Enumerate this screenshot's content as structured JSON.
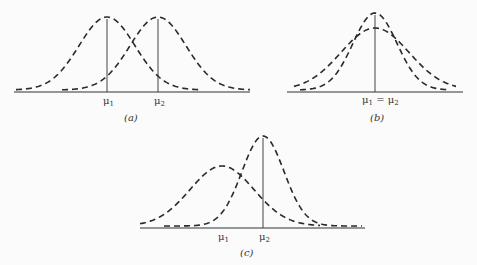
{
  "panels": [
    {
      "id": "a",
      "caption": "(a)",
      "description": "Two normal curves with equal spread and different means",
      "mean_labels": [
        "μ1",
        "μ2"
      ],
      "means_px": [
        107,
        158
      ],
      "sigma_px": 28,
      "peak_heights_px": [
        73,
        73
      ]
    },
    {
      "id": "b",
      "caption": "(b)",
      "description": "Two normal curves with equal means and different spreads",
      "mean_labels": [
        "μ1 = μ2"
      ],
      "means_px": [
        375,
        375
      ],
      "sigma_px": [
        22,
        34
      ],
      "peak_heights_px": [
        77,
        62
      ]
    },
    {
      "id": "c",
      "caption": "(c)",
      "description": "Two normal curves with different means and different spreads",
      "mean_labels": [
        "μ1",
        "μ2"
      ],
      "means_px": [
        222,
        263
      ],
      "sigma_px": [
        32,
        21
      ],
      "peak_heights_px": [
        60,
        90
      ]
    }
  ],
  "labels": {
    "a_mu1": "μ",
    "a_mu2": "μ",
    "b_mu": "μ",
    "b_eq": " = μ",
    "c_mu1": "μ",
    "c_mu2": "μ",
    "sub1": "1",
    "sub2": "2",
    "cap_a": "(a)",
    "cap_b": "(b)",
    "cap_c": "(c)"
  }
}
